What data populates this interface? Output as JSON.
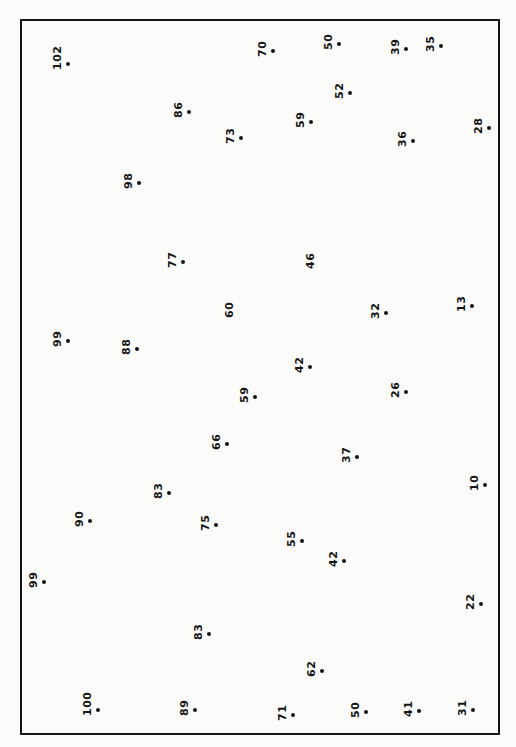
{
  "frame": {
    "left": 20,
    "top": 19,
    "right": 498,
    "bottom": 733
  },
  "points": [
    {
      "label": "102",
      "x": 68,
      "y": 64,
      "dot": true
    },
    {
      "label": "70",
      "x": 273,
      "y": 51,
      "dot": true
    },
    {
      "label": "50",
      "x": 339,
      "y": 44,
      "dot": true
    },
    {
      "label": "39",
      "x": 406,
      "y": 49,
      "dot": true
    },
    {
      "label": "35",
      "x": 441,
      "y": 46,
      "dot": true
    },
    {
      "label": "52",
      "x": 350,
      "y": 93,
      "dot": true
    },
    {
      "label": "86",
      "x": 189,
      "y": 112,
      "dot": true
    },
    {
      "label": "59",
      "x": 311,
      "y": 122,
      "dot": true
    },
    {
      "label": "73",
      "x": 241,
      "y": 138,
      "dot": true
    },
    {
      "label": "36",
      "x": 413,
      "y": 141,
      "dot": true
    },
    {
      "label": "28",
      "x": 489,
      "y": 128,
      "dot": true
    },
    {
      "label": "98",
      "x": 139,
      "y": 183,
      "dot": true
    },
    {
      "label": "77",
      "x": 183,
      "y": 262,
      "dot": true
    },
    {
      "label": "46",
      "x": 321,
      "y": 263,
      "dot": false
    },
    {
      "label": "60",
      "x": 240,
      "y": 312,
      "dot": false
    },
    {
      "label": "32",
      "x": 386,
      "y": 313,
      "dot": true
    },
    {
      "label": "13",
      "x": 472,
      "y": 306,
      "dot": true
    },
    {
      "label": "99",
      "x": 68,
      "y": 341,
      "dot": true
    },
    {
      "label": "88",
      "x": 137,
      "y": 349,
      "dot": true
    },
    {
      "label": "42",
      "x": 310,
      "y": 367,
      "dot": true
    },
    {
      "label": "59",
      "x": 255,
      "y": 397,
      "dot": true
    },
    {
      "label": "26",
      "x": 406,
      "y": 392,
      "dot": true
    },
    {
      "label": "66",
      "x": 227,
      "y": 444,
      "dot": true
    },
    {
      "label": "37",
      "x": 357,
      "y": 457,
      "dot": true
    },
    {
      "label": "10",
      "x": 485,
      "y": 485,
      "dot": true
    },
    {
      "label": "83",
      "x": 169,
      "y": 493,
      "dot": true
    },
    {
      "label": "90",
      "x": 90,
      "y": 521,
      "dot": true
    },
    {
      "label": "75",
      "x": 216,
      "y": 525,
      "dot": true
    },
    {
      "label": "55",
      "x": 302,
      "y": 541,
      "dot": true
    },
    {
      "label": "42",
      "x": 344,
      "y": 561,
      "dot": true
    },
    {
      "label": "99",
      "x": 44,
      "y": 582,
      "dot": true
    },
    {
      "label": "22",
      "x": 481,
      "y": 604,
      "dot": true
    },
    {
      "label": "83",
      "x": 209,
      "y": 634,
      "dot": true
    },
    {
      "label": "62",
      "x": 322,
      "y": 671,
      "dot": true
    },
    {
      "label": "100",
      "x": 98,
      "y": 710,
      "dot": true
    },
    {
      "label": "89",
      "x": 195,
      "y": 710,
      "dot": true
    },
    {
      "label": "71",
      "x": 293,
      "y": 715,
      "dot": true
    },
    {
      "label": "50",
      "x": 366,
      "y": 712,
      "dot": true
    },
    {
      "label": "41",
      "x": 419,
      "y": 711,
      "dot": true
    },
    {
      "label": "31",
      "x": 473,
      "y": 710,
      "dot": true
    }
  ]
}
